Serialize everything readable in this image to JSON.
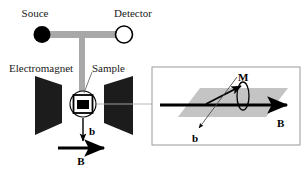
{
  "figure": {
    "type": "schematic-diagram",
    "title_visible": false,
    "background_color": "#ffffff"
  },
  "colors": {
    "ink": "#1a1a1a",
    "black": "#000000",
    "waveguide_gray": "#a8a8a8",
    "magnet_fill": "#1c1c1c",
    "plane_gray": "#c4c4c4",
    "panel_border": "#999999",
    "callout_gray": "#b0b0b0"
  },
  "left_panel": {
    "labels": {
      "source": "Souce",
      "detector": "Detector",
      "electromagnet": "Electromagnet",
      "sample": "Sample",
      "rf_field": "b",
      "static_field": "B"
    },
    "elements": {
      "source_marker": "filled-circle",
      "detector_marker": "open-circle",
      "waveguide_shape": "T-shaped-bar",
      "magnet_pole_shape": "trapezoid",
      "sample_marker": "square-in-circle",
      "rf_arrow_direction": "down",
      "static_arrow_direction": "right"
    }
  },
  "right_panel": {
    "labels": {
      "magnetization": "M",
      "rf_field": "b",
      "static_field": "B"
    },
    "elements": {
      "plane_shape": "parallelogram",
      "magnetization_arrow_direction": "up-right",
      "precession_orbit": "vertical-ellipse",
      "rf_arrow_direction": "down-left",
      "static_arrow_direction": "right"
    }
  },
  "callout": {
    "from": "sample",
    "to": "detail-panel",
    "style": "thin-gray-line"
  }
}
